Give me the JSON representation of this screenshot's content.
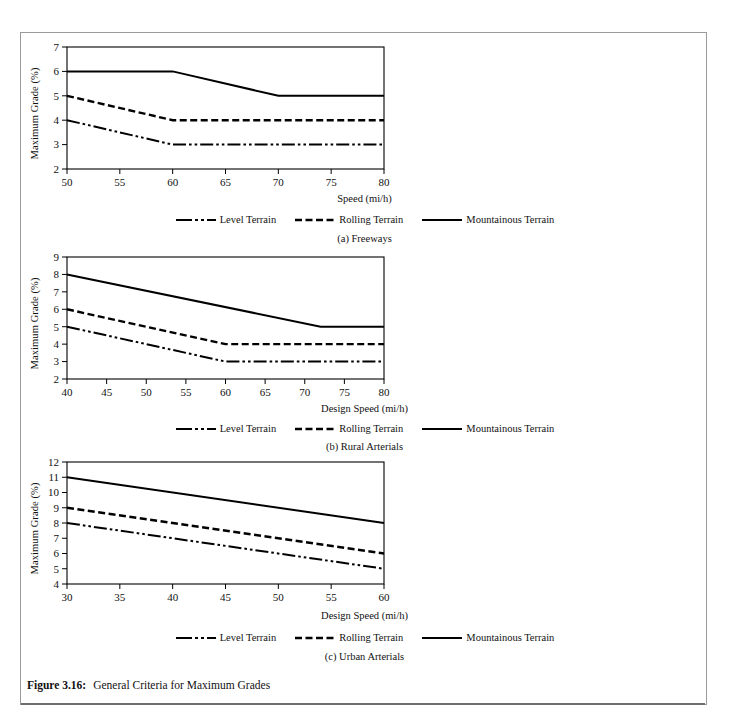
{
  "figure": {
    "caption_number": "Figure 3.16:",
    "caption_text": "General Criteria for Maximum Grades"
  },
  "legend_labels": {
    "level": "Level Terrain",
    "rolling": "Rolling Terrain",
    "mountainous": "Mountainous Terrain"
  },
  "colors": {
    "line": "#000000",
    "axis": "#000000",
    "frame": "#9a9a9a",
    "rule": "#6f6f6f",
    "background": "#ffffff"
  },
  "charts": [
    {
      "id": "a",
      "subcaption": "(a) Freeways",
      "ylabel": "Maximum Grade (%)",
      "xlabel": "Speed (mi/h)"
    },
    {
      "id": "b",
      "subcaption": "(b) Rural Arterials",
      "ylabel": "Maximum Grade (%)",
      "xlabel": "Design Speed (mi/h)"
    },
    {
      "id": "c",
      "subcaption": "(c) Urban Arterials",
      "ylabel": "Maximum Grade (%)",
      "xlabel": "Design Speed (mi/h)"
    }
  ],
  "chart_data": [
    {
      "type": "line",
      "id": "a",
      "title": "(a) Freeways",
      "xlabel": "Speed (mi/h)",
      "ylabel": "Maximum Grade (%)",
      "xlim": [
        50,
        80
      ],
      "ylim": [
        2,
        7
      ],
      "xticks": [
        50,
        55,
        60,
        65,
        70,
        75,
        80
      ],
      "yticks": [
        2,
        3,
        4,
        5,
        6,
        7
      ],
      "grid": false,
      "legend_position": "below",
      "series": [
        {
          "name": "Level Terrain",
          "style": "dash-dot-dot",
          "x": [
            50,
            60,
            70,
            80
          ],
          "y": [
            4,
            3,
            3,
            3
          ]
        },
        {
          "name": "Rolling Terrain",
          "style": "dashed",
          "x": [
            50,
            60,
            70,
            80
          ],
          "y": [
            5,
            4,
            4,
            4
          ]
        },
        {
          "name": "Mountainous Terrain",
          "style": "solid",
          "x": [
            50,
            60,
            70,
            80
          ],
          "y": [
            6,
            6,
            5,
            5
          ]
        }
      ]
    },
    {
      "type": "line",
      "id": "b",
      "title": "(b) Rural Arterials",
      "xlabel": "Design Speed (mi/h)",
      "ylabel": "Maximum Grade (%)",
      "xlim": [
        40,
        80
      ],
      "ylim": [
        2,
        9
      ],
      "xticks": [
        40,
        45,
        50,
        55,
        60,
        65,
        70,
        75,
        80
      ],
      "yticks": [
        2,
        3,
        4,
        5,
        6,
        7,
        8,
        9
      ],
      "grid": false,
      "legend_position": "below",
      "series": [
        {
          "name": "Level Terrain",
          "style": "dash-dot-dot",
          "x": [
            40,
            60,
            80
          ],
          "y": [
            5,
            3,
            3
          ]
        },
        {
          "name": "Rolling Terrain",
          "style": "dashed",
          "x": [
            40,
            60,
            80
          ],
          "y": [
            6,
            4,
            4
          ]
        },
        {
          "name": "Mountainous Terrain",
          "style": "solid",
          "x": [
            40,
            72,
            80
          ],
          "y": [
            8,
            5,
            5
          ]
        }
      ]
    },
    {
      "type": "line",
      "id": "c",
      "title": "(c) Urban Arterials",
      "xlabel": "Design Speed (mi/h)",
      "ylabel": "Maximum Grade (%)",
      "xlim": [
        30,
        60
      ],
      "ylim": [
        4,
        12
      ],
      "xticks": [
        30,
        35,
        40,
        45,
        50,
        55,
        60
      ],
      "yticks": [
        4,
        5,
        6,
        7,
        8,
        9,
        10,
        11,
        12
      ],
      "grid": false,
      "legend_position": "below",
      "series": [
        {
          "name": "Level Terrain",
          "style": "dash-dot-dot",
          "x": [
            30,
            60
          ],
          "y": [
            8,
            5
          ]
        },
        {
          "name": "Rolling Terrain",
          "style": "dashed",
          "x": [
            30,
            60
          ],
          "y": [
            9,
            6
          ]
        },
        {
          "name": "Mountainous Terrain",
          "style": "solid",
          "x": [
            30,
            60
          ],
          "y": [
            11,
            8
          ]
        }
      ]
    }
  ]
}
